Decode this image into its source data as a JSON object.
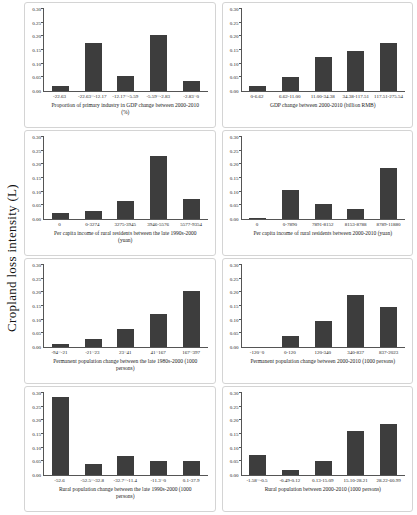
{
  "figure": {
    "y_axis_shared_label": "Cropland loss intensity (L)",
    "yticks": [
      "0.00",
      "0.05",
      "0.10",
      "0.15",
      "0.20",
      "0.25",
      "0.30"
    ],
    "bar_color": "#3d3d3d",
    "axis_color": "#555555",
    "panel_border_color": "#d4d4d4"
  },
  "chart_data": [
    {
      "type": "bar",
      "title": "",
      "xlabel": "Proportion of primary industry in GDP change between 2000-2010 (%)",
      "ylabel": "Cropland loss intensity (L)",
      "categories": [
        "-22.63",
        "-22.63~-12.17",
        "-12.17~-5.59",
        "-5.59~-2.83",
        "-2.83~0"
      ],
      "values": [
        0.02,
        0.175,
        0.055,
        0.205,
        0.035
      ],
      "ylim": [
        0,
        0.3
      ],
      "grid": false
    },
    {
      "type": "bar",
      "title": "",
      "xlabel": "GDP change between 2000-2010 (billion RMB)",
      "ylabel": "Cropland loss intensity (L)",
      "categories": [
        "0-6.62",
        "6.62-11.00",
        "11.00-34.38",
        "34.38-117.51",
        "117.51-275.54"
      ],
      "values": [
        0.02,
        0.053,
        0.125,
        0.145,
        0.175
      ],
      "ylim": [
        0,
        0.3
      ],
      "grid": false
    },
    {
      "type": "bar",
      "title": "",
      "xlabel": "Per capita income of rural residents between the late 1990s-2000 (yuan)",
      "ylabel": "Cropland loss intensity (L)",
      "categories": [
        "0",
        "0-3274",
        "3275-3945",
        "3946-5576",
        "5577-9354"
      ],
      "values": [
        0.021,
        0.028,
        0.065,
        0.23,
        0.075
      ],
      "ylim": [
        0,
        0.3
      ],
      "grid": false
    },
    {
      "type": "bar",
      "title": "",
      "xlabel": "Per capita income of rural residents between 2000-2010 (yuan)",
      "ylabel": "Cropland loss intensity (L)",
      "categories": [
        "0",
        "0-7890",
        "7891-8152",
        "8153-8788",
        "8789-11880"
      ],
      "values": [
        0.003,
        0.105,
        0.055,
        0.037,
        0.185
      ],
      "ylim": [
        0,
        0.3
      ],
      "grid": false
    },
    {
      "type": "bar",
      "title": "",
      "xlabel": "Permanent population change between the late 1980s-2000 (1000 persons)",
      "ylabel": "Cropland loss intensity (L)",
      "categories": [
        "-94~-21",
        "-21~23",
        "23~41",
        "41~167",
        "167~397"
      ],
      "values": [
        0.01,
        0.03,
        0.067,
        0.12,
        0.205
      ],
      "ylim": [
        0,
        0.3
      ],
      "grid": false
    },
    {
      "type": "bar",
      "title": "",
      "xlabel": "Permanent population change between 2000-2010 (1000 persons)",
      "ylabel": "Cropland loss intensity (L)",
      "categories": [
        "-120~0",
        "0-120",
        "120-340",
        "340-837",
        "837-2023"
      ],
      "values": [
        0.0,
        0.04,
        0.095,
        0.19,
        0.148
      ],
      "ylim": [
        0,
        0.3
      ],
      "grid": false
    },
    {
      "type": "bar",
      "title": "",
      "xlabel": "Rural population change between the late 1990s-2000 (1000 persons)",
      "ylabel": "Cropland loss intensity (L)",
      "categories": [
        "-52.6",
        "-52.5~-32.8",
        "-32.7~-11.4",
        "-11.3~0",
        "0.1-37.9"
      ],
      "values": [
        0.287,
        0.04,
        0.07,
        0.05,
        0.05
      ],
      "ylim": [
        0,
        0.3
      ],
      "grid": false
    },
    {
      "type": "bar",
      "title": "",
      "xlabel": "Rural population between 2000-2010 (1000 persons)",
      "ylabel": "Cropland loss intensity (L)",
      "categories": [
        "-1.58~-0.5",
        "-0.49-0.12",
        "0.13-15.09",
        "15.10-28.21",
        "28.22-60.99"
      ],
      "values": [
        0.075,
        0.02,
        0.053,
        0.16,
        0.185
      ],
      "ylim": [
        0,
        0.3
      ],
      "grid": false
    }
  ]
}
